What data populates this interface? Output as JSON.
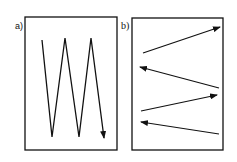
{
  "panels": [
    {
      "id": "a",
      "label": "a)",
      "description": "vertical zigzag scan pattern",
      "box": {
        "x": 25,
        "y": 17,
        "width": 92,
        "height": 133
      },
      "path": [
        [
          42,
          40
        ],
        [
          52,
          137
        ],
        [
          65,
          38
        ],
        [
          79,
          137
        ],
        [
          91,
          38
        ],
        [
          104,
          138
        ]
      ]
    },
    {
      "id": "b",
      "label": "b)",
      "description": "horizontal alternating arrows",
      "box": {
        "x": 132,
        "y": 18,
        "width": 91,
        "height": 132
      },
      "arrows": [
        {
          "from": [
            143,
            53
          ],
          "to": [
            220,
            27
          ]
        },
        {
          "from": [
            219,
            88
          ],
          "to": [
            140,
            67
          ]
        },
        {
          "from": [
            141,
            111
          ],
          "to": [
            217,
            95
          ]
        },
        {
          "from": [
            219,
            134
          ],
          "to": [
            141,
            122
          ]
        }
      ]
    }
  ],
  "colors": {
    "stroke": "#111111",
    "background": "#ffffff"
  }
}
